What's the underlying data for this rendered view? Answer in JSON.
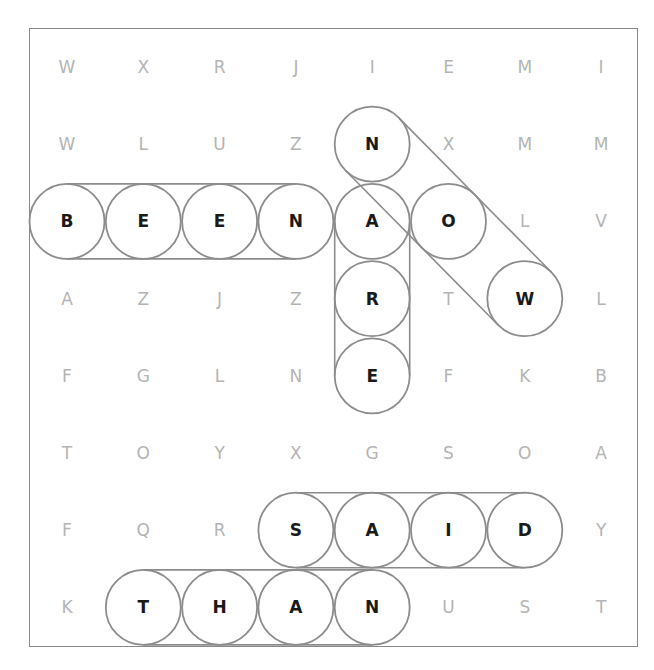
{
  "puzzle": {
    "rows": 8,
    "cols": 8,
    "grid": [
      [
        "W",
        "X",
        "R",
        "J",
        "I",
        "E",
        "M",
        "I"
      ],
      [
        "W",
        "L",
        "U",
        "Z",
        "N",
        "X",
        "M",
        "M"
      ],
      [
        "B",
        "E",
        "E",
        "N",
        "A",
        "O",
        "L",
        "V"
      ],
      [
        "A",
        "Z",
        "J",
        "Z",
        "R",
        "T",
        "W",
        "L"
      ],
      [
        "F",
        "G",
        "L",
        "N",
        "E",
        "F",
        "K",
        "B"
      ],
      [
        "T",
        "O",
        "Y",
        "X",
        "G",
        "S",
        "O",
        "A"
      ],
      [
        "F",
        "Q",
        "R",
        "S",
        "A",
        "I",
        "D",
        "Y"
      ],
      [
        "K",
        "T",
        "H",
        "A",
        "N",
        "U",
        "S",
        "T"
      ]
    ],
    "found_words": [
      {
        "word": "BEEN",
        "start": [
          2,
          0
        ],
        "end": [
          2,
          3
        ],
        "direction": "horizontal"
      },
      {
        "word": "NOW",
        "start": [
          1,
          4
        ],
        "end": [
          3,
          6
        ],
        "direction": "diagonal-down-right"
      },
      {
        "word": "ARE",
        "start": [
          2,
          4
        ],
        "end": [
          4,
          4
        ],
        "direction": "vertical"
      },
      {
        "word": "SAID",
        "start": [
          6,
          3
        ],
        "end": [
          6,
          6
        ],
        "direction": "horizontal"
      },
      {
        "word": "THAN",
        "start": [
          7,
          1
        ],
        "end": [
          7,
          4
        ],
        "direction": "horizontal"
      }
    ]
  },
  "colors": {
    "border": "#8a8a8a",
    "highlight_stroke": "#8c8c8c",
    "found_letter": "#1a1a1a",
    "unfound_letter": "#b4b4b4",
    "background": "#ffffff"
  }
}
